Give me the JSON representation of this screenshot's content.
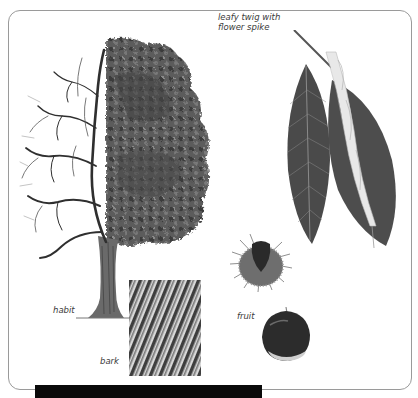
{
  "illustration": {
    "subject": "sweet chestnut",
    "labels": {
      "twig": "leafy twig with\nflower spike",
      "habit": "habit",
      "bark": "bark",
      "fruit": "fruit"
    }
  },
  "footer": {
    "text": ""
  },
  "colors": {
    "panel_border": "#9a9a9a",
    "ink": "#3a3a3a",
    "footer_bg": "#0a0a0a"
  }
}
